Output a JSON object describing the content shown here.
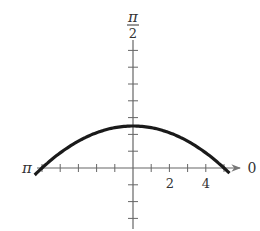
{
  "chart_data": {
    "type": "line",
    "coordinate_system": "polar",
    "title": "",
    "equation_inferred": "r = 5/(1 + sin θ)",
    "axis_labels": {
      "polar_axis": "0",
      "left": "π",
      "top_numerator": "π",
      "top_denominator": "2"
    },
    "x_tick_labels": [
      "2",
      "4"
    ],
    "x_ticks": [
      -5,
      -4,
      -3,
      -2,
      -1,
      1,
      2,
      3,
      4,
      5
    ],
    "y_ticks": [
      -3,
      -2,
      -1,
      1,
      2,
      3,
      4,
      5,
      6,
      7
    ],
    "xlim": [
      -5.5,
      6
    ],
    "ylim": [
      -3.5,
      7.5
    ],
    "grid": false,
    "series": [
      {
        "name": "r = 5/(1 + sin θ)",
        "x": [
          -5.5,
          -5,
          -4,
          -3,
          -2,
          -1,
          0,
          1,
          2,
          3,
          4,
          5,
          5.3
        ],
        "y": [
          -0.5,
          0,
          0.9,
          1.6,
          2.1,
          2.4,
          2.5,
          2.4,
          2.1,
          1.6,
          0.9,
          0,
          -0.3
        ]
      }
    ],
    "colors": {
      "axis": "#555555",
      "curve": "#1a1a1a"
    }
  }
}
